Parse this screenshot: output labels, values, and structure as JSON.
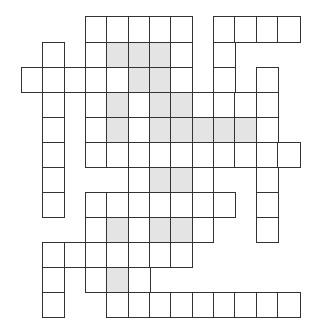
{
  "puzzle": {
    "type": "crossword-grid",
    "columns": 13,
    "rows": 12,
    "colors": {
      "line": "#333333",
      "cell": "#ffffff",
      "shaded": "#e4e4e4"
    },
    "col_edges": [
      21.5,
      43,
      64.3,
      86,
      107,
      128.5,
      150,
      171,
      192.5,
      213.5,
      235,
      256.5,
      278,
      300
    ],
    "row_edges": [
      17,
      42.5,
      67.5,
      92.5,
      117.5,
      142.5,
      167.5,
      192.5,
      217.5,
      242.5,
      267.5,
      292.5,
      317.5
    ],
    "grid": [
      {
        "row": 0,
        "cells": [
          3,
          4,
          5,
          6,
          7,
          9,
          10,
          11,
          12
        ],
        "shaded": []
      },
      {
        "row": 1,
        "cells": [
          1,
          3,
          4,
          5,
          6,
          7,
          9
        ],
        "shaded": [
          4,
          5,
          6
        ]
      },
      {
        "row": 2,
        "cells": [
          0,
          1,
          2,
          3,
          4,
          5,
          6,
          7,
          9,
          11
        ],
        "shaded": [
          5,
          6
        ]
      },
      {
        "row": 3,
        "cells": [
          1,
          3,
          4,
          5,
          6,
          7,
          8,
          9,
          10,
          11
        ],
        "shaded": [
          4,
          6,
          7
        ]
      },
      {
        "row": 4,
        "cells": [
          1,
          3,
          4,
          5,
          6,
          7,
          8,
          9,
          10,
          11
        ],
        "shaded": [
          4,
          6,
          7,
          8,
          9,
          10
        ]
      },
      {
        "row": 5,
        "cells": [
          1,
          3,
          4,
          5,
          6,
          7,
          8,
          9,
          10,
          11,
          12
        ],
        "shaded": []
      },
      {
        "row": 6,
        "cells": [
          1,
          5,
          6,
          7,
          8,
          11
        ],
        "shaded": [
          6,
          7
        ]
      },
      {
        "row": 7,
        "cells": [
          1,
          3,
          4,
          5,
          6,
          7,
          8,
          9,
          11
        ],
        "shaded": []
      },
      {
        "row": 8,
        "cells": [
          3,
          4,
          5,
          6,
          7,
          8,
          11
        ],
        "shaded": [
          4,
          6,
          7
        ]
      },
      {
        "row": 9,
        "cells": [
          1,
          2,
          3,
          4,
          5,
          6,
          7
        ],
        "shaded": []
      },
      {
        "row": 10,
        "cells": [
          1,
          3,
          4,
          5
        ],
        "shaded": [
          4
        ]
      },
      {
        "row": 11,
        "cells": [
          1,
          4,
          5,
          6,
          7,
          8,
          9,
          10,
          11,
          12
        ],
        "shaded": []
      }
    ]
  }
}
